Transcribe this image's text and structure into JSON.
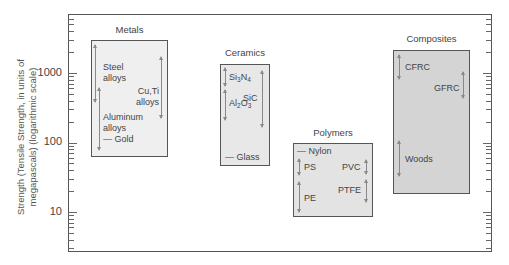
{
  "chart_data": {
    "type": "range-box",
    "title": "",
    "ylabel": "Strength (Tensile Strength, in units of megapascals) (logarithmic scale)",
    "yscale": "log",
    "ylim": [
      3,
      6000
    ],
    "yticks": [
      10,
      100,
      1000
    ],
    "ytick_labels": [
      "10",
      "100",
      "1000"
    ],
    "grid": false,
    "groups": [
      {
        "name": "Metals",
        "range": [
          60,
          3000
        ],
        "color": "#efefef",
        "items": [
          {
            "name": "Steel alloys",
            "range": [
              300,
              2200
            ]
          },
          {
            "name": "Cu,Ti alloys",
            "range": [
              150,
              1600
            ]
          },
          {
            "name": "Aluminum alloys",
            "range": [
              70,
              500
            ]
          },
          {
            "name": "Gold",
            "value": 120
          }
        ]
      },
      {
        "name": "Ceramics",
        "range": [
          45,
          1350
        ],
        "color": "#e8e8e8",
        "items": [
          {
            "name": "Si3N4",
            "range": [
              650,
              1200
            ]
          },
          {
            "name": "Al2O3",
            "range": [
              270,
              650
            ]
          },
          {
            "name": "SiC",
            "range": [
              200,
              1200
            ]
          },
          {
            "name": "Glass",
            "value": 55
          }
        ]
      },
      {
        "name": "Polymers",
        "range": [
          8,
          97
        ],
        "color": "#e3e3e3",
        "items": [
          {
            "name": "Nylon",
            "value": 80
          },
          {
            "name": "PS",
            "range": [
              35,
              65
            ]
          },
          {
            "name": "PVC",
            "range": [
              40,
              65
            ]
          },
          {
            "name": "PE",
            "range": [
              10,
              35
            ]
          },
          {
            "name": "PTFE",
            "range": [
              15,
              35
            ]
          }
        ]
      },
      {
        "name": "Composites",
        "range": [
          18,
          2150
        ],
        "color": "#d4d4d4",
        "items": [
          {
            "name": "CFRC",
            "range": [
              500,
              1800
            ]
          },
          {
            "name": "GFRC",
            "range": [
              400,
              1200
            ]
          },
          {
            "name": "Woods",
            "range": [
              40,
              160
            ]
          }
        ]
      }
    ]
  },
  "axis": {
    "title": "Strength (Tensile Strength, in units of megapascals) (logarithmic scale)",
    "ticks": [
      "1000",
      "100",
      "10"
    ]
  },
  "groups": {
    "metals": {
      "title": "Metals",
      "steel_1": "Steel",
      "steel_2": "alloys",
      "cuti_1": "Cu,Ti",
      "cuti_2": "alloys",
      "al_1": "Aluminum",
      "al_2": "alloys",
      "gold": "— Gold"
    },
    "ceramics": {
      "title": "Ceramics",
      "si": "Si",
      "si_sub": "3",
      "n": "N",
      "n_sub": "4",
      "al": "Al",
      "al_sub": "2",
      "o": "O",
      "o_sub": "3",
      "sic": "SiC",
      "glass": "— Glass"
    },
    "polymers": {
      "title": "Polymers",
      "nylon": "— Nylon",
      "ps": "PS",
      "pvc": "PVC",
      "pe": "PE",
      "ptfe": "PTFE"
    },
    "composites": {
      "title": "Composites",
      "cfrc": "CFRC",
      "gfrc": "GFRC",
      "woods": "Woods"
    }
  }
}
